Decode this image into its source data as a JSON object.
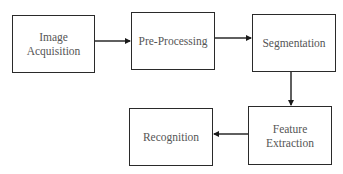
{
  "diagram": {
    "type": "flowchart",
    "nodes": [
      {
        "id": "acquisition",
        "label": "Image\nAcquisition"
      },
      {
        "id": "preprocessing",
        "label": "Pre-Processing"
      },
      {
        "id": "segmentation",
        "label": "Segmentation"
      },
      {
        "id": "feature_extraction",
        "label": "Feature\nExtraction"
      },
      {
        "id": "recognition",
        "label": "Recognition"
      }
    ],
    "edges": [
      {
        "from": "acquisition",
        "to": "preprocessing"
      },
      {
        "from": "preprocessing",
        "to": "segmentation"
      },
      {
        "from": "segmentation",
        "to": "feature_extraction"
      },
      {
        "from": "feature_extraction",
        "to": "recognition"
      }
    ],
    "colors": {
      "stroke": "#2a2a2a",
      "text": "#555555",
      "background": "#ffffff"
    }
  }
}
